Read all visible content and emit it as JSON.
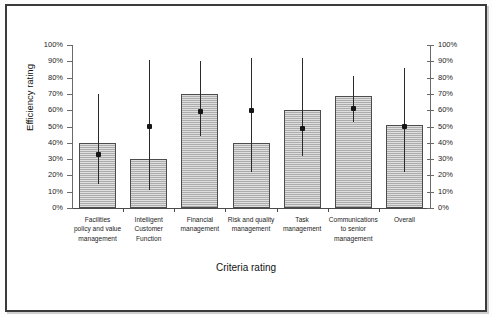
{
  "chart_data": {
    "type": "bar",
    "title": "",
    "xlabel": "Criteria rating",
    "ylabel": "Efficiency rating",
    "ylim": [
      0,
      100
    ],
    "grid": false,
    "legend": null,
    "y_tick_labels": [
      "100%",
      "90%",
      "80%",
      "70%",
      "60%",
      "50%",
      "40%",
      "30%",
      "20%",
      "10%",
      "0%"
    ],
    "y_ticks": [
      100,
      90,
      80,
      70,
      60,
      50,
      40,
      30,
      20,
      10,
      0
    ],
    "right_axis_tick_labels": [
      "100%",
      "90%",
      "80%",
      "70%",
      "60%",
      "50%",
      "40%",
      "30%",
      "20%",
      "10%",
      "0%"
    ],
    "categories": [
      "Facilities policy and value management",
      "Intelligent Customer Function",
      "Financial management",
      "Risk and quality management",
      "Task management",
      "Communications to senior management",
      "Overall"
    ],
    "category_label_lines": [
      [
        "Facilities",
        "policy and value",
        "management"
      ],
      [
        "Intelligent",
        "Customer",
        "Function"
      ],
      [
        "Financial",
        "management"
      ],
      [
        "Risk and quality",
        "management"
      ],
      [
        "Task",
        "management"
      ],
      [
        "Communications",
        "to senior",
        "management"
      ],
      [
        "Overall"
      ]
    ],
    "values": [
      40,
      30,
      70,
      40,
      60,
      69,
      51
    ],
    "series": [
      {
        "name": "Efficiency rating (bar)",
        "values": [
          40,
          30,
          70,
          40,
          60,
          69,
          51
        ]
      },
      {
        "name": "Marker (point estimate)",
        "values": [
          33,
          50,
          59,
          60,
          49,
          61,
          50
        ]
      }
    ],
    "error_bars": [
      {
        "low": 15,
        "high": 70
      },
      {
        "low": 11,
        "high": 91
      },
      {
        "low": 44,
        "high": 90
      },
      {
        "low": 22,
        "high": 92
      },
      {
        "low": 32,
        "high": 92
      },
      {
        "low": 53,
        "high": 81
      },
      {
        "low": 22,
        "high": 86
      }
    ],
    "colors": {
      "bar_fill": "#b9b9b9",
      "bar_border": "#4c4c4c",
      "whisker": "#2a2a2a",
      "marker": "#151515",
      "axis": "#4a4a4a",
      "text": "#1d1d1d",
      "frame": "#3b3b3b"
    }
  }
}
